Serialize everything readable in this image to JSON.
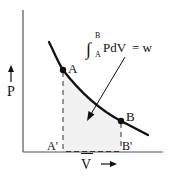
{
  "diagram": {
    "axes": {
      "y_label": "P",
      "x_label": "V",
      "x_label_overbar": true
    },
    "points": [
      {
        "name": "A",
        "label": "A",
        "projection_label": "A'"
      },
      {
        "name": "B",
        "label": "B",
        "projection_label": "B'"
      }
    ],
    "equation": {
      "integral_upper": "B",
      "integral_lower": "A",
      "integrand": "PdV",
      "equals": "= w"
    },
    "colors": {
      "curve": "#111111",
      "axes": "#555555",
      "shaded_area": "#f1f1f1",
      "dashes": "#333333"
    }
  }
}
